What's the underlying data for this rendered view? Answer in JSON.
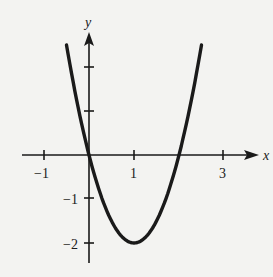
{
  "chart_data": {
    "type": "line",
    "title": "",
    "xlabel": "x",
    "ylabel": "y",
    "function": "y = 2x^2 - 4x",
    "x_ticks": [
      -1,
      0,
      1,
      2,
      3
    ],
    "x_tick_labels": [
      "-1",
      "1",
      "3"
    ],
    "x_tick_label_text": {
      "m1": "−1",
      "p1": "1",
      "p3": "3"
    },
    "y_ticks": [
      -2,
      -1,
      1,
      2
    ],
    "y_tick_labels": [
      "-2",
      "-1"
    ],
    "y_tick_label_text": {
      "m1": "−1",
      "m2": "−2"
    },
    "xlim": [
      -1.5,
      3.8
    ],
    "ylim": [
      -2.6,
      3.0
    ],
    "grid": false,
    "legend": null,
    "series": [
      {
        "name": "parabola",
        "x": [
          -0.5,
          0,
          0.5,
          1,
          1.5,
          2,
          2.5
        ],
        "y": [
          2.5,
          0,
          -1.5,
          -2,
          -1.5,
          0,
          2.5
        ]
      }
    ],
    "key_points": {
      "vertex": [
        1,
        -2
      ],
      "roots": [
        0,
        2
      ]
    }
  }
}
